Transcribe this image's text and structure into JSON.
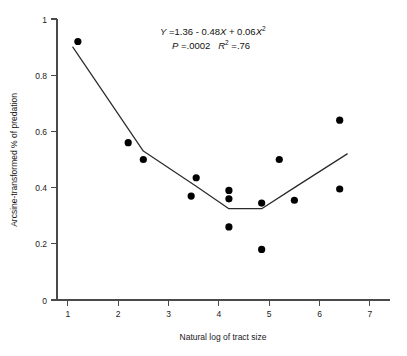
{
  "chart_data": {
    "type": "scatter",
    "title": "",
    "xlabel": "Natural log of tract size",
    "ylabel": "Arcsine-transformed % of predation",
    "xlim": [
      1,
      7
    ],
    "ylim": [
      0,
      1
    ],
    "xticks": [
      "1",
      "2",
      "3",
      "4",
      "5",
      "6",
      "7"
    ],
    "xtick_values": [
      1,
      2,
      3,
      4,
      5,
      6,
      7
    ],
    "yticks": [
      "0",
      "0.2",
      "0.4",
      "0.6",
      "0.8",
      "1"
    ],
    "ytick_values": [
      0,
      0.2,
      0.4,
      0.6,
      0.8,
      1
    ],
    "grid": false,
    "legend": null,
    "points": [
      {
        "x": 1.2,
        "y": 0.92
      },
      {
        "x": 2.2,
        "y": 0.56
      },
      {
        "x": 2.5,
        "y": 0.5
      },
      {
        "x": 3.45,
        "y": 0.37
      },
      {
        "x": 3.55,
        "y": 0.435
      },
      {
        "x": 4.2,
        "y": 0.39
      },
      {
        "x": 4.2,
        "y": 0.36
      },
      {
        "x": 4.2,
        "y": 0.26
      },
      {
        "x": 4.85,
        "y": 0.345
      },
      {
        "x": 4.85,
        "y": 0.18
      },
      {
        "x": 5.2,
        "y": 0.5
      },
      {
        "x": 5.5,
        "y": 0.355
      },
      {
        "x": 6.4,
        "y": 0.64
      },
      {
        "x": 6.4,
        "y": 0.395
      }
    ],
    "fit_curve": {
      "label": "quadratic regression fit",
      "vertices": [
        {
          "x": 1.1,
          "y": 0.9
        },
        {
          "x": 2.5,
          "y": 0.53
        },
        {
          "x": 3.55,
          "y": 0.405
        },
        {
          "x": 4.2,
          "y": 0.325
        },
        {
          "x": 4.85,
          "y": 0.325
        },
        {
          "x": 5.5,
          "y": 0.4
        },
        {
          "x": 6.55,
          "y": 0.52
        }
      ]
    },
    "annotations": {
      "equation_y": "Y",
      "equation_body": " =1.36 - 0.48",
      "equation_x1": "X",
      "equation_plus": " + 0.06",
      "equation_x2": "X",
      "equation_exp": "2",
      "p_symbol": "P",
      "p_value": " =.0002",
      "r_symbol": "R",
      "r_exp": "2",
      "r_value": " =.76"
    }
  }
}
